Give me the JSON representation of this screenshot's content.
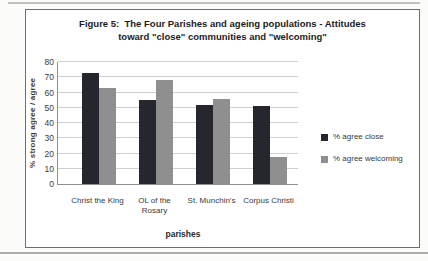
{
  "page": {
    "title_line1": "Figure 5:  The Four Parishes and ageing populations - Attitudes",
    "title_line2": "toward \"close\" communities and \"welcoming\""
  },
  "chart_data": {
    "type": "bar",
    "title": "Figure 5: The Four Parishes and ageing populations - Attitudes toward \"close\" communities and \"welcoming\"",
    "categories": [
      "Christ the King",
      "OL of the Rosary",
      "St. Munchin's",
      "Corpus Christi"
    ],
    "series": [
      {
        "name": "% agree close",
        "color": "#26262e",
        "values": [
          73,
          55,
          52,
          51
        ]
      },
      {
        "name": "% agree welcoming",
        "color": "#8f8f8f",
        "values": [
          63,
          68,
          56,
          18
        ]
      }
    ],
    "xlabel": "parishes",
    "ylabel": "% strong agree / agree",
    "ylim": [
      0,
      80
    ],
    "ytick_step": 10,
    "grid": true,
    "legend_position": "right",
    "gridline_color": "#cfcfcf"
  }
}
